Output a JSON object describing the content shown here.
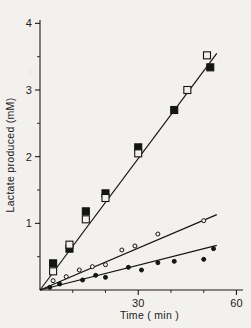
{
  "figure": {
    "background_color": "#f3f1ee",
    "ink_color": "#1b1b1b"
  },
  "chart_data": {
    "type": "scatter",
    "title": "",
    "subtitle": "",
    "xlabel": "Time ( min )",
    "ylabel": "Lactate produced (mM)",
    "xlim": [
      0,
      62
    ],
    "ylim": [
      0,
      4.05
    ],
    "xticks": [
      30,
      60
    ],
    "xticklabels": [
      "30",
      "60"
    ],
    "x_minor_ticks": [
      10,
      20,
      40,
      50
    ],
    "yticks": [
      1,
      2,
      3,
      4
    ],
    "yticklabels": [
      "1",
      "2",
      "3",
      "4"
    ],
    "y_minor_ticks": [
      0.5,
      1.5,
      2.5,
      3.5
    ],
    "grid": false,
    "legend": "none",
    "legend_position": "none",
    "annotations": [],
    "series": [
      {
        "name": "filled-squares",
        "marker": "filled-square",
        "marker_size": 7,
        "color": "#141414",
        "fit_line": {
          "x": [
            0,
            54
          ],
          "y": [
            0,
            3.55
          ],
          "slope": 0.0657
        },
        "points": [
          {
            "x": 4,
            "y": 0.4
          },
          {
            "x": 9,
            "y": 0.62
          },
          {
            "x": 14,
            "y": 1.18
          },
          {
            "x": 20,
            "y": 1.45
          },
          {
            "x": 30,
            "y": 2.14
          },
          {
            "x": 41,
            "y": 2.7
          },
          {
            "x": 52,
            "y": 3.34
          }
        ]
      },
      {
        "name": "open-squares",
        "marker": "open-square",
        "marker_size": 7,
        "color": "#141414",
        "fit_line": null,
        "points": [
          {
            "x": 4,
            "y": 0.28
          },
          {
            "x": 9,
            "y": 0.68
          },
          {
            "x": 14,
            "y": 1.06
          },
          {
            "x": 20,
            "y": 1.38
          },
          {
            "x": 30,
            "y": 2.05
          },
          {
            "x": 45,
            "y": 3.0
          },
          {
            "x": 51,
            "y": 3.52
          }
        ]
      },
      {
        "name": "open-circles",
        "marker": "open-circle",
        "marker_size": 4,
        "color": "#141414",
        "fit_line": {
          "x": [
            0,
            54
          ],
          "y": [
            0,
            1.13
          ],
          "slope": 0.0209
        },
        "points": [
          {
            "x": 4,
            "y": 0.14
          },
          {
            "x": 8,
            "y": 0.2
          },
          {
            "x": 12,
            "y": 0.3
          },
          {
            "x": 16,
            "y": 0.35
          },
          {
            "x": 20,
            "y": 0.38
          },
          {
            "x": 25,
            "y": 0.6
          },
          {
            "x": 29,
            "y": 0.66
          },
          {
            "x": 36,
            "y": 0.84
          },
          {
            "x": 50,
            "y": 1.04
          }
        ]
      },
      {
        "name": "filled-circles",
        "marker": "filled-circle",
        "marker_size": 4,
        "color": "#141414",
        "fit_line": {
          "x": [
            0,
            54
          ],
          "y": [
            0,
            0.67
          ],
          "slope": 0.0124
        },
        "points": [
          {
            "x": 3,
            "y": 0.04
          },
          {
            "x": 6,
            "y": 0.09
          },
          {
            "x": 13,
            "y": 0.15
          },
          {
            "x": 17,
            "y": 0.22
          },
          {
            "x": 20,
            "y": 0.19
          },
          {
            "x": 27,
            "y": 0.34
          },
          {
            "x": 31,
            "y": 0.3
          },
          {
            "x": 36,
            "y": 0.41
          },
          {
            "x": 41,
            "y": 0.43
          },
          {
            "x": 50,
            "y": 0.46
          },
          {
            "x": 53,
            "y": 0.62
          }
        ]
      }
    ]
  }
}
